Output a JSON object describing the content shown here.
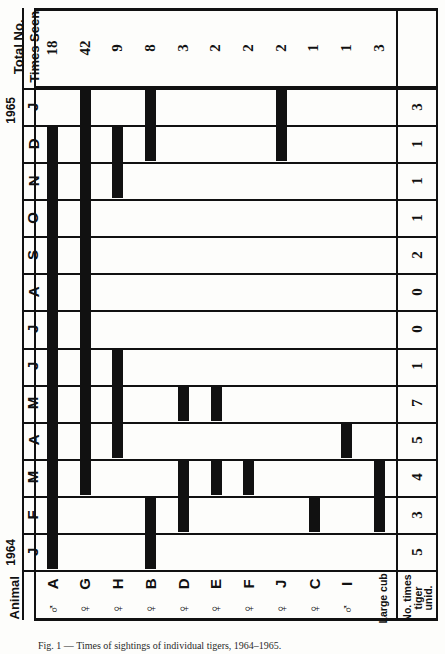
{
  "figure": {
    "type": "gantt-presence-chart",
    "orientation": "rotated-90",
    "header_total_label_line1": "Total  No.",
    "header_total_label_line2": "Times Seen",
    "animal_axis_label": "Animal",
    "unid_label_line1": "No. times",
    "unid_label_line2": "tiger",
    "unid_label_line3": "unid.",
    "large_cub_label": "Large cub",
    "year_1965": "1965",
    "year_1964": "1964",
    "ink_color": "#111111",
    "paper_color": "#fdfdfb"
  },
  "chart_data": {
    "type": "heatmap",
    "xlabel": "Animal",
    "ylabel": "Month",
    "grid": true,
    "legend": "none",
    "categories": [
      "A",
      "G",
      "H",
      "B",
      "D",
      "E",
      "F",
      "J",
      "C",
      "I",
      "Large cub"
    ],
    "animals": [
      {
        "id": "A",
        "sex": "male",
        "sex_symbol": "♂",
        "total_times_seen": 18
      },
      {
        "id": "G",
        "sex": "female",
        "sex_symbol": "♀",
        "total_times_seen": 42
      },
      {
        "id": "H",
        "sex": "female",
        "sex_symbol": "♀",
        "total_times_seen": 9
      },
      {
        "id": "B",
        "sex": "female",
        "sex_symbol": "♀",
        "total_times_seen": 8
      },
      {
        "id": "D",
        "sex": "female",
        "sex_symbol": "♀",
        "total_times_seen": 3
      },
      {
        "id": "E",
        "sex": "female",
        "sex_symbol": "♀",
        "total_times_seen": 2
      },
      {
        "id": "F",
        "sex": "female",
        "sex_symbol": "♀",
        "total_times_seen": 2
      },
      {
        "id": "J",
        "sex": "female",
        "sex_symbol": "♀",
        "total_times_seen": 2
      },
      {
        "id": "C",
        "sex": "female",
        "sex_symbol": "♀",
        "total_times_seen": 1
      },
      {
        "id": "I",
        "sex": "male",
        "sex_symbol": "♂",
        "total_times_seen": 1
      },
      {
        "id": "Large cub",
        "sex": "",
        "sex_symbol": "",
        "total_times_seen": 3
      }
    ],
    "total_times_seen": [
      18,
      42,
      9,
      8,
      3,
      2,
      2,
      2,
      1,
      1,
      3
    ],
    "months": [
      {
        "label": "J",
        "year": "1965",
        "unid": 3
      },
      {
        "label": "D",
        "year": "",
        "unid": 1
      },
      {
        "label": "N",
        "year": "",
        "unid": 1
      },
      {
        "label": "O",
        "year": "",
        "unid": 1
      },
      {
        "label": "S",
        "year": "",
        "unid": 2
      },
      {
        "label": "A",
        "year": "",
        "unid": 0
      },
      {
        "label": "J",
        "year": "",
        "unid": 0
      },
      {
        "label": "J",
        "year": "",
        "unid": 1
      },
      {
        "label": "M",
        "year": "",
        "unid": 7
      },
      {
        "label": "A",
        "year": "",
        "unid": 5
      },
      {
        "label": "M",
        "year": "",
        "unid": 4
      },
      {
        "label": "F",
        "year": "",
        "unid": 3
      },
      {
        "label": "J",
        "year": "1964",
        "unid": 5
      }
    ],
    "unid_values": [
      3,
      1,
      1,
      1,
      2,
      0,
      0,
      1,
      7,
      5,
      4,
      3,
      5
    ],
    "presence_matrix_note": "rows = months (J1965 top -> J1964 bottom), columns = animals A,G,H,B,D,E,F,J,C,I,Large cub; 1 = seen",
    "presence": [
      {
        "month": "J-1965",
        "seen": [
          "G",
          "B",
          "J"
        ]
      },
      {
        "month": "D-1964",
        "seen": [
          "A",
          "G",
          "H",
          "B",
          "J"
        ]
      },
      {
        "month": "N-1964",
        "seen": [
          "A",
          "G",
          "H"
        ]
      },
      {
        "month": "O-1964",
        "seen": [
          "A",
          "G"
        ]
      },
      {
        "month": "S-1964",
        "seen": [
          "A",
          "G"
        ]
      },
      {
        "month": "A-1964",
        "seen": [
          "A",
          "G"
        ]
      },
      {
        "month": "J-1964b",
        "seen": [
          "A",
          "G"
        ]
      },
      {
        "month": "J-1964a",
        "seen": [
          "A",
          "G",
          "H"
        ]
      },
      {
        "month": "M-1964b",
        "seen": [
          "A",
          "G",
          "H",
          "D",
          "E"
        ]
      },
      {
        "month": "A-1964",
        "seen": [
          "A",
          "G",
          "H",
          "I"
        ]
      },
      {
        "month": "M-1964a",
        "seen": [
          "A",
          "G",
          "D",
          "E",
          "F",
          "Large cub"
        ]
      },
      {
        "month": "F-1964",
        "seen": [
          "A",
          "B",
          "D",
          "C",
          "Large cub"
        ]
      },
      {
        "month": "J-1964",
        "seen": [
          "A",
          "B"
        ]
      }
    ]
  },
  "caption": "Fig. 1 — Times of sightings of individual tigers, 1964–1965."
}
